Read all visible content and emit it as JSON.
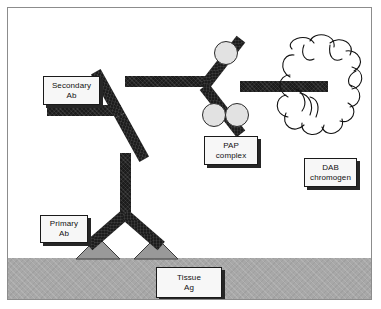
{
  "figure": {
    "type": "diagram",
    "width": 381,
    "height": 309,
    "background_color": "#ffffff",
    "frame_border_color": "#8c8c8c"
  },
  "labels": {
    "secondary_ab": {
      "line1": "Secondary",
      "line2": "Ab"
    },
    "primary_ab": {
      "line1": "Primary",
      "line2": "Ab"
    },
    "pap_complex": {
      "line1": "PAP",
      "line2": "complex"
    },
    "dab_chromogen": {
      "line1": "DAB",
      "line2": "chromogen"
    },
    "tissue_ag": {
      "line1": "Tissue",
      "line2": "Ag"
    }
  },
  "elements": {
    "antibody_color": "#1c1c1c",
    "peroxidase_circle_color": "#e2e2e2",
    "peroxidase_circle_border": "#2b2b2b",
    "antigen_triangle_color": "#999999",
    "antigen_triangle_border": "#3a3a3a",
    "tissue_band_color": "#a8a8a8",
    "cloud_stroke_color": "#111111",
    "callout_fill": "#f7f7f7",
    "callout_border": "#1a1a1a",
    "callout_shadow": "#262626"
  },
  "counts": {
    "antibodies": 3,
    "peroxidase_circles": 3,
    "antigen_triangles": 2
  }
}
